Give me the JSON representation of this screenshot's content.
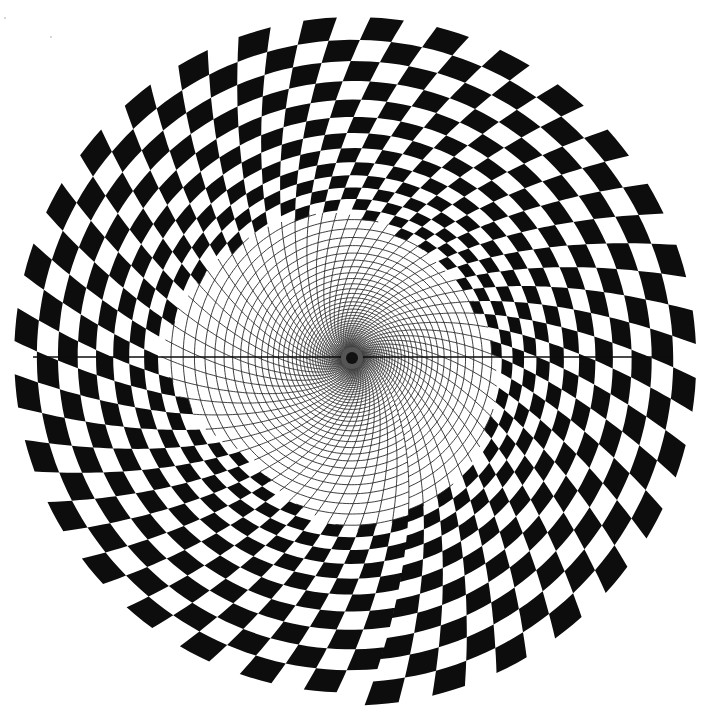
{
  "artwork": {
    "kind": "op-art spiral checkerboard",
    "background_color": "#ffffff",
    "ink_color": "#0d0d0d",
    "line_color": "#2a2a2a",
    "center": [
      352,
      358
    ],
    "spoke_count": 64,
    "spoke_twist": 0.42,
    "ring_min_radius": 9,
    "ring_max_radius": 328,
    "ring_growth": 1.072,
    "ring_twist_per_turn": 0.55,
    "web_line_width": 0.9,
    "hub": {
      "outer_radius": 11,
      "inner_radius": 6,
      "color": "#111111"
    },
    "horizontal_axis": {
      "y": 357,
      "x_start": 33,
      "x_end": 672,
      "width": 1.4
    },
    "checker_inner_boundary": [
      [
        0,
        143
      ],
      [
        45,
        160
      ],
      [
        90,
        172
      ],
      [
        135,
        140
      ],
      [
        180,
        190
      ],
      [
        225,
        160
      ],
      [
        270,
        143
      ],
      [
        315,
        125
      ],
      [
        360,
        143
      ]
    ]
  },
  "specks": [
    [
      4,
      17
    ],
    [
      50,
      36
    ]
  ]
}
